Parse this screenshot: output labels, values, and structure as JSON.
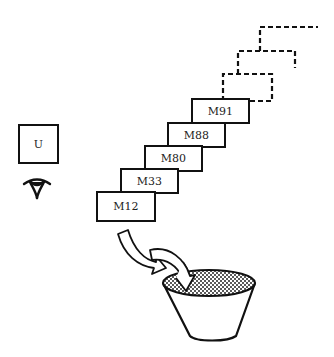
{
  "diagram": {
    "left_symbol": {
      "label": "U",
      "icon": "eye-icon"
    },
    "stairs": [
      {
        "label": "M12"
      },
      {
        "label": "M33"
      },
      {
        "label": "M80"
      },
      {
        "label": "M88"
      },
      {
        "label": "M91"
      }
    ],
    "future_steps": 3,
    "container": {
      "icon": "bucket-icon",
      "fill": "stippled"
    },
    "arrows": 2
  }
}
